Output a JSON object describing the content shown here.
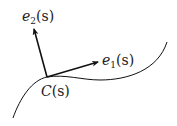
{
  "diagram": {
    "colors": {
      "stroke": "#111111",
      "text": "#222222",
      "background": "#ffffff"
    },
    "curve_label": {
      "main": "C",
      "arg": "(s)"
    },
    "vector_e1": {
      "main": "e",
      "sub": "1",
      "arg": "(s)"
    },
    "vector_e2": {
      "main": "e",
      "sub": "2",
      "arg": "(s)"
    }
  }
}
